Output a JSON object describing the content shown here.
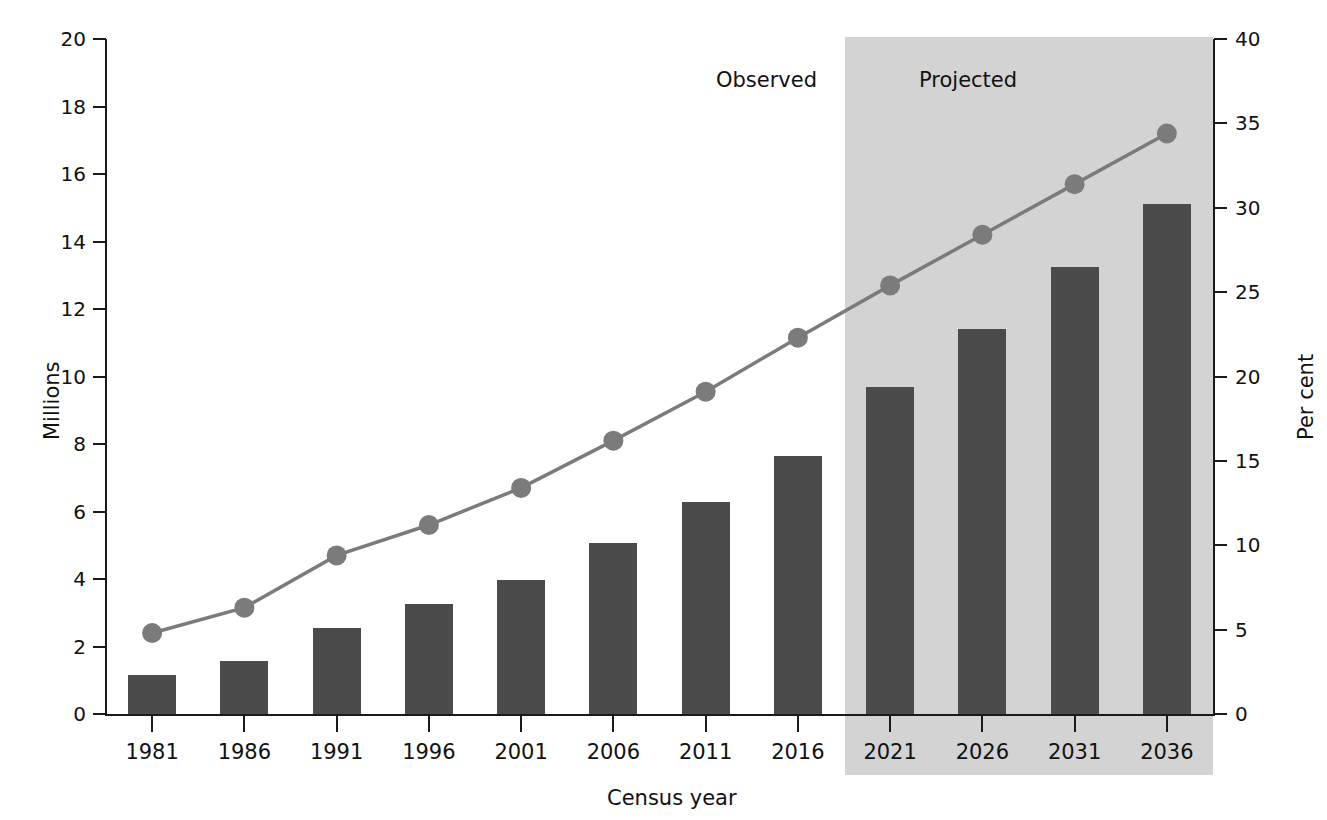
{
  "chart_data": {
    "type": "bar",
    "title": "",
    "subtitle": "",
    "xlabel": "Census year",
    "ylabel": "Millions",
    "y2label": "Per cent",
    "categories": [
      "1981",
      "1986",
      "1991",
      "1996",
      "2001",
      "2006",
      "2011",
      "2016",
      "2021",
      "2026",
      "2031",
      "2036"
    ],
    "ylim": [
      0,
      20
    ],
    "yticks": [
      0,
      2,
      4,
      6,
      8,
      10,
      12,
      14,
      16,
      18,
      20
    ],
    "y2lim": [
      0,
      40
    ],
    "y2ticks": [
      0,
      5,
      10,
      15,
      20,
      25,
      30,
      35,
      40
    ],
    "grid": false,
    "legend_position": "none",
    "series": [
      {
        "name": "Millions",
        "kind": "bar",
        "axis": "left",
        "color": "#4b4b4b",
        "values": [
          1.15,
          1.57,
          2.55,
          3.25,
          3.98,
          5.08,
          6.28,
          7.65,
          9.7,
          11.4,
          13.25,
          15.1
        ]
      },
      {
        "name": "Per cent",
        "kind": "line",
        "axis": "right",
        "color": "#7b7b7b",
        "values": [
          4.8,
          6.3,
          9.4,
          11.2,
          13.4,
          16.2,
          19.1,
          22.3,
          25.4,
          28.4,
          31.4,
          34.4
        ]
      }
    ],
    "annotations": [
      {
        "text": "Observed",
        "x_category": "2016",
        "region": "unshaded"
      },
      {
        "text": "Projected",
        "x_category": "2021",
        "region": "shaded"
      }
    ],
    "shaded_region": {
      "label": "Projected",
      "from_category": "2021",
      "to_category": "2036",
      "color": "#d3d3d3"
    }
  },
  "labels": {
    "observed": "Observed",
    "projected": "Projected",
    "y_left_title": "Millions",
    "y_right_title": "Per cent",
    "x_title": "Census year"
  }
}
